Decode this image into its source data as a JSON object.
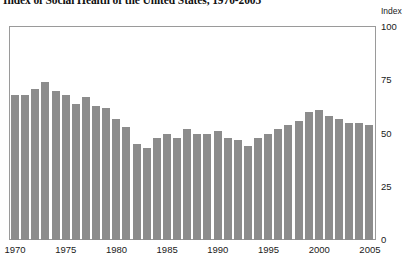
{
  "chart_data": {
    "type": "bar",
    "title": "Index of Social Health of the United States, 1970-2005",
    "xlabel": "",
    "ylabel": "Index",
    "unit_caption": "Index",
    "ylim": [
      0,
      100
    ],
    "yticks": [
      0,
      25,
      50,
      75,
      100
    ],
    "ytick_labels": [
      "0",
      "25",
      "50",
      "75",
      "100"
    ],
    "xticks": [
      1970,
      1975,
      1980,
      1985,
      1990,
      1995,
      2000,
      2005
    ],
    "xtick_labels": [
      "1970",
      "1975",
      "1980",
      "1985",
      "1990",
      "1995",
      "2000",
      "2005"
    ],
    "grid": false,
    "legend": "none",
    "bar_color": "#8c8c8c",
    "frame_color": "#9a9a9a",
    "categories": [
      "1970",
      "1971",
      "1972",
      "1973",
      "1974",
      "1975",
      "1976",
      "1977",
      "1978",
      "1979",
      "1980",
      "1981",
      "1982",
      "1983",
      "1984",
      "1985",
      "1986",
      "1987",
      "1988",
      "1989",
      "1990",
      "1991",
      "1992",
      "1993",
      "1994",
      "1995",
      "1996",
      "1997",
      "1998",
      "1999",
      "2000",
      "2001",
      "2002",
      "2003",
      "2004",
      "2005"
    ],
    "values": [
      68,
      68,
      71,
      74,
      70,
      68,
      64,
      67,
      63,
      62,
      57,
      53,
      45,
      43,
      48,
      50,
      48,
      52,
      50,
      50,
      51,
      48,
      47,
      44,
      48,
      50,
      52,
      54,
      56,
      60,
      61,
      58,
      57,
      55,
      55,
      54
    ]
  }
}
